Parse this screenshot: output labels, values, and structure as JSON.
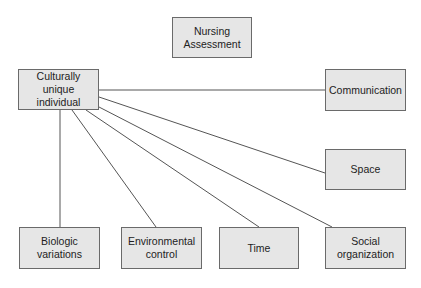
{
  "diagram": {
    "title_node": {
      "label": "Nursing\nAssessment"
    },
    "center_node": {
      "label": "Culturally\nunique\nindividual"
    },
    "factor_nodes": [
      {
        "id": "communication",
        "label": "Communication"
      },
      {
        "id": "space",
        "label": "Space"
      },
      {
        "id": "biologic",
        "label": "Biologic\nvariations"
      },
      {
        "id": "environmental",
        "label": "Environmental\ncontrol"
      },
      {
        "id": "time",
        "label": "Time"
      },
      {
        "id": "social",
        "label": "Social\norganization"
      }
    ],
    "edges": [
      {
        "from": "center_node",
        "to": "communication"
      },
      {
        "from": "center_node",
        "to": "space"
      },
      {
        "from": "center_node",
        "to": "biologic"
      },
      {
        "from": "center_node",
        "to": "environmental"
      },
      {
        "from": "center_node",
        "to": "time"
      },
      {
        "from": "center_node",
        "to": "social"
      }
    ],
    "colors": {
      "box_fill": "#e6e6e6",
      "box_border": "#6a6a6a",
      "line": "#555555",
      "text": "#222222"
    }
  }
}
